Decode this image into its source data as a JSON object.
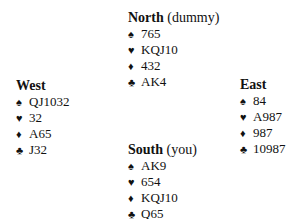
{
  "hands": {
    "north": {
      "name": "North",
      "role": "(dummy)",
      "suits": [
        {
          "icon": "spade-icon",
          "symbol": "♠",
          "cards": "765"
        },
        {
          "icon": "heart-icon",
          "symbol": "♥",
          "cards": "KQJ10"
        },
        {
          "icon": "diamond-icon",
          "symbol": "♦",
          "cards": "432"
        },
        {
          "icon": "club-icon",
          "symbol": "♣",
          "cards": "AK4"
        }
      ]
    },
    "west": {
      "name": "West",
      "role": "",
      "suits": [
        {
          "icon": "spade-icon",
          "symbol": "♠",
          "cards": "QJ1032"
        },
        {
          "icon": "heart-icon",
          "symbol": "♥",
          "cards": "32"
        },
        {
          "icon": "diamond-icon",
          "symbol": "♦",
          "cards": "A65"
        },
        {
          "icon": "club-icon",
          "symbol": "♣",
          "cards": "J32"
        }
      ]
    },
    "east": {
      "name": "East",
      "role": "",
      "suits": [
        {
          "icon": "spade-icon",
          "symbol": "♠",
          "cards": "84"
        },
        {
          "icon": "heart-icon",
          "symbol": "♥",
          "cards": "A987"
        },
        {
          "icon": "diamond-icon",
          "symbol": "♦",
          "cards": "987"
        },
        {
          "icon": "club-icon",
          "symbol": "♣",
          "cards": "10987"
        }
      ]
    },
    "south": {
      "name": "South",
      "role": "(you)",
      "suits": [
        {
          "icon": "spade-icon",
          "symbol": "♠",
          "cards": "AK9"
        },
        {
          "icon": "heart-icon",
          "symbol": "♥",
          "cards": "654"
        },
        {
          "icon": "diamond-icon",
          "symbol": "♦",
          "cards": "KQJ10"
        },
        {
          "icon": "club-icon",
          "symbol": "♣",
          "cards": "Q65"
        }
      ]
    }
  }
}
